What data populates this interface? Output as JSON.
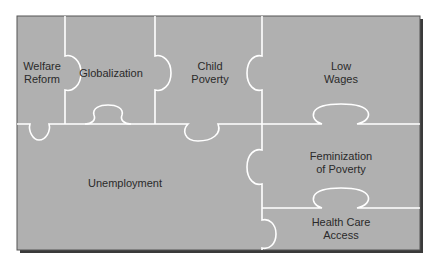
{
  "diagram": {
    "colors": {
      "panel": "#b0b0b0",
      "lines": "#ffffff",
      "shadow": "#3a3a3a",
      "border": "#555555",
      "text": "#2a2a2a"
    },
    "pieces": [
      {
        "id": "welfare-reform",
        "label": "Welfare\nReform",
        "x": 42,
        "y": 73
      },
      {
        "id": "globalization",
        "label": "Globalization",
        "x": 111,
        "y": 73
      },
      {
        "id": "child-poverty",
        "label": "Child\nPoverty",
        "x": 210,
        "y": 73
      },
      {
        "id": "low-wages",
        "label": "Low\nWages",
        "x": 341,
        "y": 73
      },
      {
        "id": "unemployment",
        "label": "Unemployment",
        "x": 125,
        "y": 183
      },
      {
        "id": "feminization-of-poverty",
        "label": "Feminization\nof Poverty",
        "x": 341,
        "y": 163
      },
      {
        "id": "health-care-access",
        "label": "Health Care\nAccess",
        "x": 341,
        "y": 229
      }
    ]
  }
}
